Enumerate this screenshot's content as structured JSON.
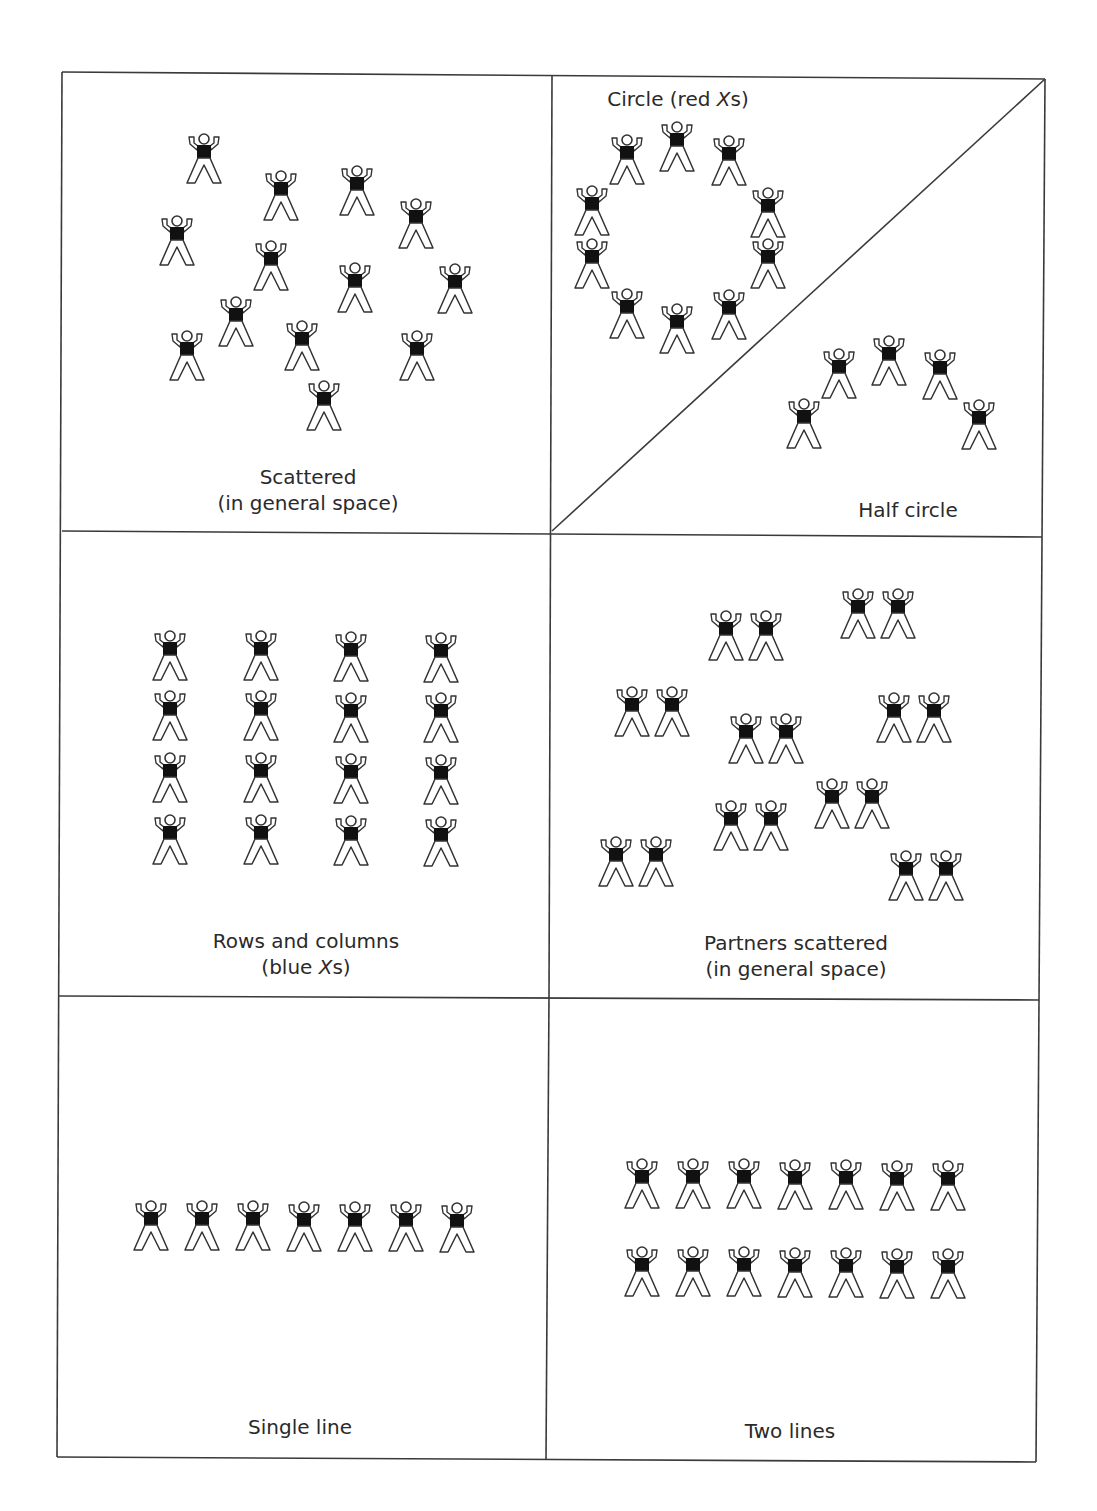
{
  "colors": {
    "line": "#3a3a3a",
    "torso": "#111111",
    "text": "#2a2a2a"
  },
  "grid": {
    "outer": [
      [
        62,
        72
      ],
      [
        1045,
        79
      ],
      [
        1036,
        1462
      ],
      [
        57,
        1457
      ]
    ],
    "vertical": [
      [
        552,
        76
      ],
      [
        549,
        996
      ],
      [
        546,
        1460
      ]
    ],
    "row_lines": [
      [
        [
          62,
          531
        ],
        [
          1042,
          537
        ]
      ],
      [
        [
          59,
          996
        ],
        [
          1039,
          1000
        ]
      ]
    ],
    "diagonal": [
      [
        552,
        531
      ],
      [
        1045,
        79
      ]
    ]
  },
  "panels": [
    {
      "id": "scattered",
      "label_line1": "Scattered",
      "label_line2": "(in general space)",
      "label_pos": [
        308,
        464
      ],
      "figures": [
        [
          185,
          133
        ],
        [
          262,
          170
        ],
        [
          338,
          165
        ],
        [
          397,
          198
        ],
        [
          158,
          215
        ],
        [
          252,
          240
        ],
        [
          336,
          262
        ],
        [
          436,
          263
        ],
        [
          217,
          296
        ],
        [
          283,
          320
        ],
        [
          168,
          330
        ],
        [
          398,
          330
        ],
        [
          305,
          380
        ]
      ]
    },
    {
      "id": "circle",
      "label_line1": "Circle (red ",
      "label_italic": "X",
      "label_suffix": "s)",
      "label_pos": [
        678,
        86
      ],
      "figures": [
        [
          658,
          121
        ],
        [
          608,
          134
        ],
        [
          710,
          135
        ],
        [
          573,
          185
        ],
        [
          749,
          187
        ],
        [
          573,
          238
        ],
        [
          749,
          238
        ],
        [
          608,
          288
        ],
        [
          710,
          289
        ],
        [
          658,
          303
        ]
      ]
    },
    {
      "id": "half-circle",
      "label_line1": "Half circle",
      "label_pos": [
        908,
        497
      ],
      "figures": [
        [
          785,
          398
        ],
        [
          820,
          348
        ],
        [
          870,
          335
        ],
        [
          921,
          349
        ],
        [
          960,
          399
        ]
      ]
    },
    {
      "id": "rows-and-columns",
      "label_line1": "Rows and columns",
      "label_line2_prefix": "(blue ",
      "label_italic": "X",
      "label_suffix": "s)",
      "label_pos": [
        306,
        928
      ],
      "figures": [
        [
          151,
          630
        ],
        [
          242,
          630
        ],
        [
          332,
          631
        ],
        [
          422,
          632
        ],
        [
          151,
          690
        ],
        [
          242,
          690
        ],
        [
          332,
          692
        ],
        [
          422,
          692
        ],
        [
          151,
          752
        ],
        [
          242,
          752
        ],
        [
          332,
          753
        ],
        [
          422,
          754
        ],
        [
          151,
          814
        ],
        [
          242,
          814
        ],
        [
          332,
          815
        ],
        [
          422,
          816
        ]
      ]
    },
    {
      "id": "partners-scattered",
      "label_line1": "Partners scattered",
      "label_line2": "(in general space)",
      "label_pos": [
        796,
        930
      ],
      "figures": [
        [
          707,
          610
        ],
        [
          747,
          610
        ],
        [
          839,
          588
        ],
        [
          879,
          588
        ],
        [
          613,
          686
        ],
        [
          653,
          686
        ],
        [
          727,
          713
        ],
        [
          767,
          713
        ],
        [
          875,
          692
        ],
        [
          915,
          692
        ],
        [
          712,
          800
        ],
        [
          752,
          800
        ],
        [
          813,
          778
        ],
        [
          853,
          778
        ],
        [
          597,
          836
        ],
        [
          637,
          836
        ],
        [
          887,
          850
        ],
        [
          927,
          850
        ]
      ]
    },
    {
      "id": "single-line",
      "label_line1": "Single line",
      "label_pos": [
        300,
        1414
      ],
      "figures": [
        [
          132,
          1200
        ],
        [
          183,
          1200
        ],
        [
          234,
          1200
        ],
        [
          285,
          1201
        ],
        [
          336,
          1201
        ],
        [
          387,
          1201
        ],
        [
          438,
          1202
        ]
      ]
    },
    {
      "id": "two-lines",
      "label_line1": "Two lines",
      "label_pos": [
        790,
        1418
      ],
      "figures": [
        [
          623,
          1158
        ],
        [
          674,
          1158
        ],
        [
          725,
          1158
        ],
        [
          776,
          1159
        ],
        [
          827,
          1159
        ],
        [
          878,
          1160
        ],
        [
          929,
          1160
        ],
        [
          623,
          1246
        ],
        [
          674,
          1246
        ],
        [
          725,
          1246
        ],
        [
          776,
          1247
        ],
        [
          827,
          1247
        ],
        [
          878,
          1248
        ],
        [
          929,
          1248
        ]
      ]
    }
  ]
}
